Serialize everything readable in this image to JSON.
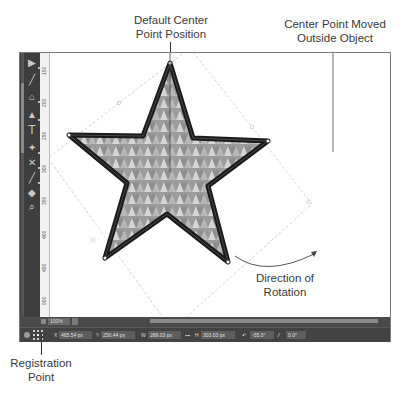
{
  "callouts": {
    "default_center": [
      "Default Center",
      "Point Position"
    ],
    "moved_center": [
      "Center Point Moved",
      "Outside Object"
    ],
    "direction": [
      "Direction of",
      "Rotation"
    ],
    "registration": [
      "Registration",
      "Point"
    ]
  },
  "toolbar": {
    "tools": [
      {
        "name": "selection-tool",
        "glyph": "▶"
      },
      {
        "name": "line-tool",
        "glyph": "╱"
      },
      {
        "name": "paint-bucket-tool",
        "glyph": "⌂"
      },
      {
        "name": "pen-tool",
        "glyph": "▲"
      },
      {
        "name": "type-tool",
        "glyph": "T"
      },
      {
        "name": "transform-tool",
        "glyph": "✦"
      },
      {
        "name": "scissors-tool",
        "glyph": "✕"
      },
      {
        "name": "eyedropper-tool",
        "glyph": "╱"
      },
      {
        "name": "hand-tool",
        "glyph": "◆"
      },
      {
        "name": "zoom-tool",
        "glyph": "⌕"
      }
    ]
  },
  "ruler": {
    "labels": [
      "150",
      "200",
      "250",
      "300",
      "350",
      "400",
      "450",
      "500"
    ]
  },
  "zoombar": {
    "zoom_value": "100%"
  },
  "status": {
    "x_label": "X",
    "x_value": "465.54 px",
    "y_label": "Y",
    "y_value": "250.44 px",
    "w_label": "W",
    "w_value": "289.03 px",
    "h_label": "H",
    "h_value": "303.03 px",
    "rotate_value": "-55.3°",
    "skew_value": "0.0°"
  },
  "colors": {
    "ui_dark": "#434343",
    "toolbar": "#3d3d3d",
    "star_stroke": "#1a1a1a",
    "tri_light": "#d8d8d8",
    "tri_mid": "#a9a9a9",
    "tri_dark": "#8e8e8e"
  }
}
